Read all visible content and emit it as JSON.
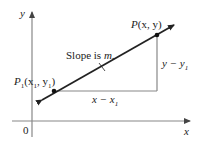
{
  "diagram": {
    "axes": {
      "x_label": "x",
      "y_label": "y",
      "origin_label": "0"
    },
    "line": {
      "annotation": "Slope is m.",
      "point_general": {
        "label": "P",
        "args": "(x, y)"
      },
      "point_fixed": {
        "label": "P",
        "sub": "1",
        "args_open": "(x",
        "args_sub1": "1",
        "args_mid": ", y",
        "args_sub2": "1",
        "args_close": ")"
      }
    },
    "triangle": {
      "horizontal_label": "x − x",
      "horizontal_sub": "1",
      "vertical_label": "y − y",
      "vertical_sub": "1"
    },
    "colors": {
      "axis": "#888888",
      "line": "#222222",
      "triangle": "#888888",
      "point": "#111111"
    }
  }
}
